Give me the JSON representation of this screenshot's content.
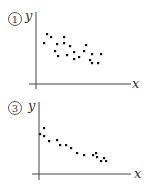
{
  "chart_data": [
    {
      "type": "scatter",
      "title": "①",
      "xlabel": "x",
      "ylabel": "y",
      "grid": false,
      "trend": "negative, moderate",
      "points": [
        [
          44,
          43
        ],
        [
          47,
          34
        ],
        [
          51,
          37
        ],
        [
          55,
          51
        ],
        [
          57,
          44
        ],
        [
          58,
          56
        ],
        [
          64,
          37
        ],
        [
          64,
          43
        ],
        [
          67,
          55
        ],
        [
          70,
          46
        ],
        [
          74,
          52
        ],
        [
          74,
          59
        ],
        [
          79,
          57
        ],
        [
          84,
          51
        ],
        [
          86,
          45
        ],
        [
          90,
          60
        ],
        [
          92,
          63
        ],
        [
          92,
          54
        ],
        [
          98,
          63
        ],
        [
          101,
          54
        ]
      ]
    },
    {
      "type": "scatter",
      "title": "③",
      "xlabel": "x",
      "ylabel": "y",
      "grid": false,
      "trend": "negative, strong",
      "points": [
        [
          40,
          134
        ],
        [
          44,
          128
        ],
        [
          44,
          136
        ],
        [
          49,
          141
        ],
        [
          57,
          140
        ],
        [
          60,
          145
        ],
        [
          66,
          145
        ],
        [
          71,
          148
        ],
        [
          77,
          153
        ],
        [
          84,
          155
        ],
        [
          93,
          155
        ],
        [
          96,
          153
        ],
        [
          97,
          157
        ],
        [
          101,
          161
        ],
        [
          104,
          158
        ],
        [
          106,
          161
        ]
      ]
    }
  ],
  "plots": [
    {
      "number_label": "1",
      "x_label": "x",
      "y_label": "y"
    },
    {
      "number_label": "3",
      "x_label": "x",
      "y_label": "y"
    }
  ]
}
